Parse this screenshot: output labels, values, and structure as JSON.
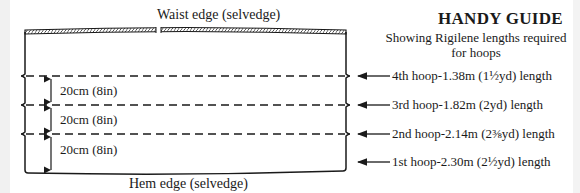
{
  "diagram": {
    "waist_label": "Waist edge (selvedge)",
    "hem_label": "Hem edge (selvedge)",
    "guide": {
      "title": "HANDY GUIDE",
      "subtitle": "Showing Rigilene lengths required for hoops"
    },
    "spacings": [
      {
        "label": "20cm (8in)"
      },
      {
        "label": "20cm (8in)"
      },
      {
        "label": "20cm (8in)"
      }
    ],
    "hoops": [
      {
        "label": "4th hoop-1.38m (1½yd) length"
      },
      {
        "label": "3rd hoop-1.82m (2yd) length"
      },
      {
        "label": "2nd hoop-2.14m (2⅜yd) length"
      },
      {
        "label": "1st hoop-2.30m (2½yd) length"
      }
    ],
    "colors": {
      "ink": "#1a1a1a",
      "background": "#ffffff",
      "margin": "#f1f1f1"
    }
  }
}
